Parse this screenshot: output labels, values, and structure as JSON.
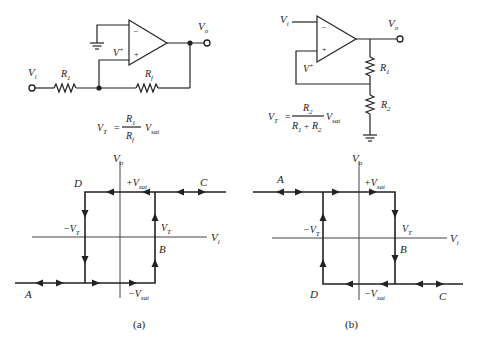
{
  "panels": [
    {
      "id": "a",
      "caption": "(a)",
      "circuit": {
        "type": "non-inverting Schmitt trigger",
        "input_label": "V",
        "input_sub": "i",
        "output_label": "V",
        "output_sub": "o",
        "vplus_label": "V",
        "vplus_sup": "+",
        "minus_sign": "−",
        "plus_sign": "+",
        "r_in_label": "R",
        "r_in_sub": "1",
        "r_fb_label": "R",
        "r_fb_sub": "f"
      },
      "formula": {
        "lhs": "V",
        "lhs_sub": "T",
        "eq": "=",
        "num": "R",
        "num_sub": "1",
        "den": "R",
        "den_sub": "f",
        "rhs": "V",
        "rhs_sub": "sat"
      },
      "graph": {
        "y_axis_label": "V",
        "y_axis_sub": "o",
        "x_axis_label": "V",
        "x_axis_sub": "i",
        "point_labels": {
          "A": "A",
          "B": "B",
          "C": "C",
          "D": "D"
        },
        "plus_vsat": "+V",
        "minus_vsat": "−V",
        "vsat_sub": "sat",
        "plus_vt": "V",
        "minus_vt": "−V",
        "vt_sub": "T"
      }
    },
    {
      "id": "b",
      "caption": "(b)",
      "circuit": {
        "type": "inverting Schmitt trigger",
        "input_label": "V",
        "input_sub": "i",
        "output_label": "V",
        "output_sub": "o",
        "vplus_label": "V",
        "vplus_sup": "+",
        "minus_sign": "−",
        "plus_sign": "+",
        "r1_label": "R",
        "r1_sub": "1",
        "r2_label": "R",
        "r2_sub": "2"
      },
      "formula": {
        "lhs": "V",
        "lhs_sub": "T",
        "eq": "=",
        "num": "R",
        "num_sub": "2",
        "den_a": "R",
        "den_a_sub": "1",
        "den_plus": "+",
        "den_b": "R",
        "den_b_sub": "2",
        "rhs": "V",
        "rhs_sub": "sat"
      },
      "graph": {
        "y_axis_label": "V",
        "y_axis_sub": "o",
        "x_axis_label": "V",
        "x_axis_sub": "i",
        "point_labels": {
          "A": "A",
          "B": "B",
          "C": "C",
          "D": "D"
        },
        "plus_vsat": "+V",
        "minus_vsat": "−V",
        "vsat_sub": "sat",
        "plus_vt": "V",
        "minus_vt": "−V",
        "vt_sub": "T"
      }
    }
  ]
}
